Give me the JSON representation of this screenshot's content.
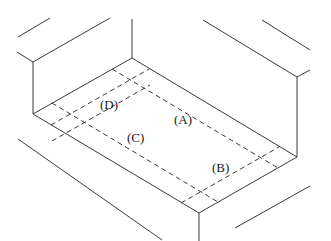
{
  "diagram": {
    "type": "isometric-floor-plan",
    "labels": [
      {
        "id": "D",
        "text": "(D)",
        "x": 100,
        "y": 109
      },
      {
        "id": "A",
        "text": "(A)",
        "x": 174,
        "y": 124
      },
      {
        "id": "C",
        "text": "(C)",
        "x": 127,
        "y": 142
      },
      {
        "id": "B",
        "text": "(B)",
        "x": 212,
        "y": 172
      }
    ],
    "colors": {
      "line": "#3a3a3a",
      "background": "#ffffff",
      "text": "#222222"
    }
  }
}
